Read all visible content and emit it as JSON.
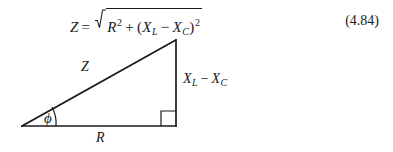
{
  "figure": {
    "type": "impedance-triangle",
    "background_color": "#ffffff",
    "ink_color": "#1a1a1a"
  },
  "equation": {
    "lhs": "Z",
    "equals": "=",
    "radical_glyph": "square-root-sign",
    "radicand": {
      "term1_base": "R",
      "term1_exponent": "2",
      "plus": "+",
      "open_paren": "(",
      "term2a_base": "X",
      "term2a_subscript": "L",
      "minus": "−",
      "term2b_base": "X",
      "term2b_subscript": "C",
      "close_paren": ")",
      "term2_exponent": "2"
    },
    "plain_text": "Z = √(R² + (X_L − X_C)²)",
    "number": "(4.84)"
  },
  "diagram": {
    "hypotenuse_label": "Z",
    "base_label": "R",
    "angle_label": "ϕ",
    "vertical_label": {
      "base1": "X",
      "sub1": "L",
      "minus": "−",
      "base2": "X",
      "sub2": "C",
      "plain_text": "X_L − X_C"
    },
    "right_angle_marker": "right-angle-square",
    "vertices": {
      "origin": [
        22,
        92
      ],
      "base_right": [
        176,
        92
      ],
      "apex": [
        176,
        6
      ]
    },
    "stroke_width": 1.6
  }
}
